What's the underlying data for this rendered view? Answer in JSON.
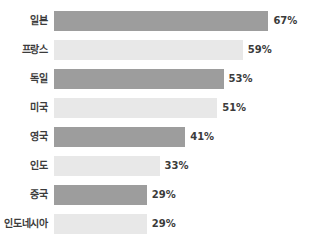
{
  "chart_data": {
    "type": "bar",
    "orientation": "horizontal",
    "title": "",
    "subtitle": "",
    "xlabel": "",
    "ylabel": "",
    "grid": false,
    "legend": false,
    "xlim": [
      0,
      100
    ],
    "value_suffix": "%",
    "categories": [
      "일본",
      "프랑스",
      "독일",
      "미국",
      "영국",
      "인도",
      "중국",
      "인도네시아"
    ],
    "values": [
      67,
      59,
      53,
      51,
      41,
      33,
      29,
      29
    ],
    "value_labels": [
      "67%",
      "59%",
      "53%",
      "51%",
      "41%",
      "33%",
      "29%",
      "29%"
    ],
    "colors": [
      "#9d9d9d",
      "#e8e8e8",
      "#9d9d9d",
      "#e8e8e8",
      "#9d9d9d",
      "#e8e8e8",
      "#9d9d9d",
      "#e8e8e8"
    ],
    "series": [
      {
        "name": "",
        "values": [
          67,
          59,
          53,
          51,
          41,
          33,
          29,
          29
        ]
      }
    ],
    "background_color": "#ffffff",
    "label_color": "#3b3b3b",
    "dark_bar_color": "#9d9d9d",
    "light_bar_color": "#e8e8e8",
    "px_per_percent": 3.2
  },
  "rows": [
    {
      "label": "일본",
      "value_label": "67%"
    },
    {
      "label": "프랑스",
      "value_label": "59%"
    },
    {
      "label": "독일",
      "value_label": "53%"
    },
    {
      "label": "미국",
      "value_label": "51%"
    },
    {
      "label": "영국",
      "value_label": "41%"
    },
    {
      "label": "인도",
      "value_label": "33%"
    },
    {
      "label": "중국",
      "value_label": "29%"
    },
    {
      "label": "인도네시아",
      "value_label": "29%"
    }
  ]
}
